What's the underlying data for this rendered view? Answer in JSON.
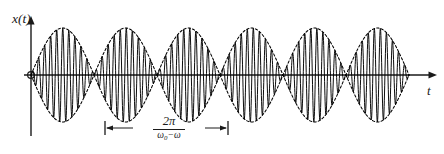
{
  "figure": {
    "kind": "beat-waveform-plot",
    "background_color": "#ffffff",
    "ink_color": "#1a1a1a",
    "y_axis_label": "x(t)",
    "x_axis_label": "t",
    "period_numerator": "2π",
    "period_den_omega0": "ω",
    "period_den_omega0_sub": "0",
    "period_den_minus": "−",
    "period_den_omega": "ω",
    "period_annotation_plain": "2π / (ω₀ − ω)"
  },
  "chart_data": {
    "type": "line",
    "title": "",
    "xlabel": "t",
    "ylabel": "x(t)",
    "grid": false,
    "legend": "none",
    "series": [
      {
        "name": "carrier",
        "style": "solid",
        "formula": "x(t) = A * sin(pi*t/T_env) * sin(2*pi*t/T_carrier)",
        "color": "#000000"
      },
      {
        "name": "envelope-upper",
        "style": "dashed",
        "formula": "+A * |sin(pi*t/T_env)|",
        "color": "#000000"
      },
      {
        "name": "envelope-lower",
        "style": "dashed",
        "formula": "-A * |sin(pi*t/T_env)|",
        "color": "#000000"
      }
    ],
    "geometry_px": {
      "origin_x": 31,
      "baseline_y": 75,
      "amplitude": 47,
      "wave_start_x": 31,
      "wave_end_x": 409,
      "envelope_half_period": 63,
      "carrier_period": 6.05,
      "y_axis_top_y": 17,
      "y_axis_bottom_y": 136,
      "x_axis_end_x": 437
    },
    "annotations": [
      {
        "name": "envelope-period",
        "label": "2π/(ω₀−ω)",
        "x_start_px": 105,
        "x_end_px": 228,
        "y_px": 128,
        "span_px": 123
      }
    ],
    "nodes_px": [
      31,
      168,
      288,
      409
    ],
    "lobe_peaks_px": [
      105,
      228,
      348
    ],
    "xlim_px": [
      31,
      437
    ],
    "ylim": [
      -47,
      47
    ]
  }
}
